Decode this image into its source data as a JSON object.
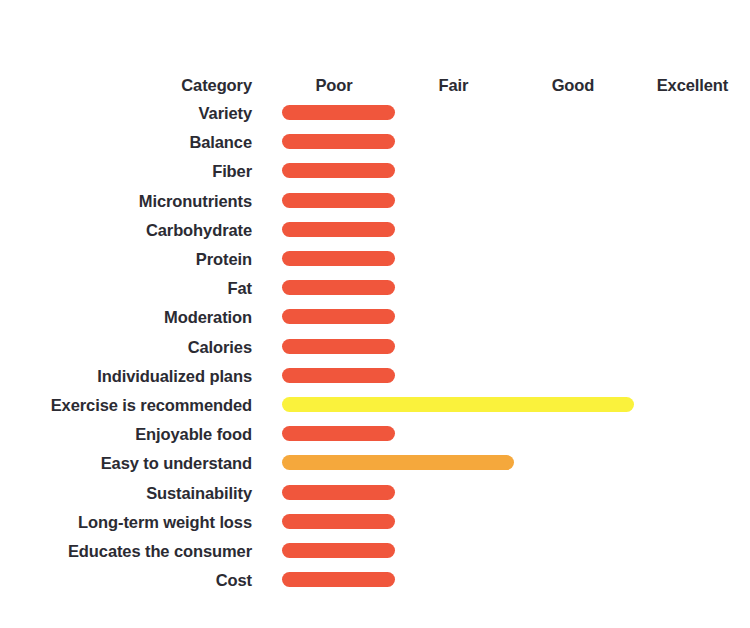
{
  "chart": {
    "type": "bar",
    "title": "",
    "subtitle": "",
    "xlabel": "",
    "ylabel": "Category",
    "orientation": "horizontal",
    "grid": false,
    "legend": "none"
  },
  "header": {
    "category_label": "Category",
    "ticks": [
      "Poor",
      "Fair",
      "Good",
      "Excellent"
    ]
  },
  "colors": {
    "poor": "#F0563C",
    "fair": "#F5A83C",
    "good": "#FAF23C",
    "text": "#2b2b33",
    "background": "#ffffff"
  },
  "chart_data": {
    "type": "bar",
    "title": "",
    "xlabel": "",
    "ylabel": "Category",
    "orientation": "horizontal",
    "grid": false,
    "legend_position": "none",
    "xlim": [
      0,
      4
    ],
    "x_tick_labels": [
      "Poor",
      "Fair",
      "Good",
      "Excellent"
    ],
    "x_tick_values": [
      1,
      2,
      3,
      4
    ],
    "categories": [
      "Variety",
      "Balance",
      "Fiber",
      "Micronutrients",
      "Carbohydrate",
      "Protein",
      "Fat",
      "Moderation",
      "Calories",
      "Individualized plans",
      "Exercise is recommended",
      "Enjoyable food",
      "Easy to understand",
      "Sustainability",
      "Long-term weight loss",
      "Educates the consumer",
      "Cost"
    ],
    "values": [
      1,
      1,
      1,
      1,
      1,
      1,
      1,
      1,
      1,
      1,
      3,
      1,
      2,
      1,
      1,
      1,
      1
    ],
    "rating_labels": [
      "Poor",
      "Poor",
      "Poor",
      "Poor",
      "Poor",
      "Poor",
      "Poor",
      "Poor",
      "Poor",
      "Poor",
      "Good",
      "Poor",
      "Fair",
      "Poor",
      "Poor",
      "Poor",
      "Poor"
    ],
    "bar_colors": [
      "#F0563C",
      "#F0563C",
      "#F0563C",
      "#F0563C",
      "#F0563C",
      "#F0563C",
      "#F0563C",
      "#F0563C",
      "#F0563C",
      "#F0563C",
      "#FAF23C",
      "#F0563C",
      "#F5A83C",
      "#F0563C",
      "#F0563C",
      "#F0563C",
      "#F0563C"
    ]
  }
}
